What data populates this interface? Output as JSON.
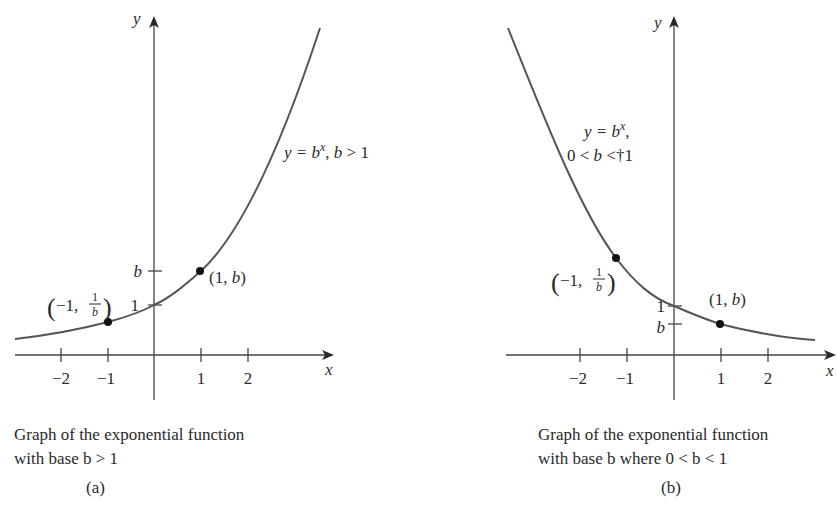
{
  "figure": {
    "panels": [
      {
        "id": "a",
        "tag": "(a)",
        "caption_line1": "Graph of the exponential function",
        "caption_line2": "with base b > 1",
        "curve_label": "y = b^x, b > 1",
        "curve_label_parts": {
          "y_eq": "y = ",
          "b": "b",
          "x_sup": "x",
          "rest": ", ",
          "b2": "b",
          "cond": " > 1"
        },
        "axis_x_label": "x",
        "axis_y_label": "y",
        "x_ticks": [
          "−2",
          "−1",
          "1",
          "2"
        ],
        "y_ticks": [
          "1",
          "b"
        ],
        "points": [
          {
            "label": "(−1, 1/b)",
            "open": "(",
            "x": "−1,",
            "num": "1",
            "den": "b",
            "close": ")"
          },
          {
            "label": "(1, b)",
            "prefix": "(1, ",
            "b": "b",
            "suffix": ")"
          }
        ]
      },
      {
        "id": "b",
        "tag": "(b)",
        "caption_line1": "Graph of the exponential function",
        "caption_line2": "with base b where 0 < b < 1",
        "curve_label": "y = b^x, 0 < b <†1",
        "curve_label_parts": {
          "y_eq": "y = ",
          "b": "b",
          "x_sup": "x",
          "comma": ",",
          "cond_pre": "0 < ",
          "b2": "b",
          "cond_post": " <†1"
        },
        "axis_x_label": "x",
        "axis_y_label": "y",
        "x_ticks": [
          "−2",
          "−1",
          "1",
          "2"
        ],
        "y_ticks": [
          "1",
          "b"
        ],
        "points": [
          {
            "label": "(−1, 1/b)",
            "open": "(",
            "x": "−1,",
            "num": "1",
            "den": "b",
            "close": ")"
          },
          {
            "label": "(1, b)",
            "prefix": "(1, ",
            "b": "b",
            "suffix": ")"
          }
        ]
      }
    ],
    "colors": {
      "ink": "#2a2a2a",
      "curve": "#555555",
      "background": "#ffffff"
    }
  }
}
